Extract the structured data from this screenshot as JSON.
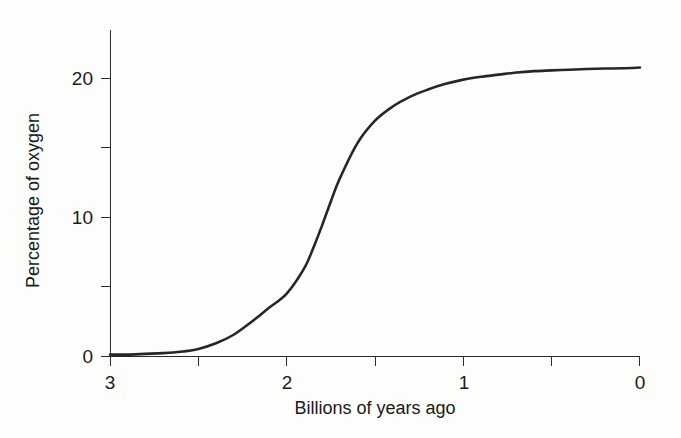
{
  "figure": {
    "background_color": "#fdfdfc",
    "curve_color": "#262626",
    "axis_color": "#2b2b2b"
  },
  "axes": {
    "x_title": "Billions of years ago",
    "y_title": "Percentage of oxygen",
    "x_tick_labels": [
      "3",
      "2",
      "1",
      "0"
    ],
    "y_tick_labels": [
      "0",
      "10",
      "20"
    ]
  },
  "chart_data": {
    "type": "line",
    "title": "",
    "subtitle": "",
    "xlabel": "Billions of years ago",
    "ylabel": "Percentage of oxygen",
    "xlim": [
      3,
      0
    ],
    "ylim": [
      0,
      23
    ],
    "x_reversed": true,
    "grid": false,
    "legend": "none",
    "x_ticks_major": [
      3,
      2,
      1,
      0
    ],
    "x_ticks_minor": [
      2.5,
      1.5,
      0.5
    ],
    "y_ticks_major": [
      0,
      10,
      20
    ],
    "y_ticks_minor": [
      5,
      15
    ],
    "series": [
      {
        "name": "Atmospheric oxygen",
        "x": [
          3.0,
          2.9,
          2.8,
          2.7,
          2.6,
          2.5,
          2.4,
          2.3,
          2.2,
          2.1,
          2.0,
          1.9,
          1.85,
          1.8,
          1.75,
          1.7,
          1.6,
          1.5,
          1.4,
          1.3,
          1.2,
          1.1,
          1.0,
          0.9,
          0.8,
          0.7,
          0.6,
          0.5,
          0.4,
          0.3,
          0.2,
          0.1,
          0.0
        ],
        "values": [
          0.1,
          0.1,
          0.15,
          0.2,
          0.3,
          0.5,
          0.9,
          1.5,
          2.4,
          3.4,
          4.4,
          6.2,
          7.6,
          9.2,
          10.9,
          12.5,
          15.0,
          16.6,
          17.6,
          18.3,
          18.8,
          19.2,
          19.5,
          19.7,
          19.85,
          20.0,
          20.1,
          20.15,
          20.2,
          20.25,
          20.28,
          20.3,
          20.35
        ]
      }
    ],
    "annotations": []
  }
}
